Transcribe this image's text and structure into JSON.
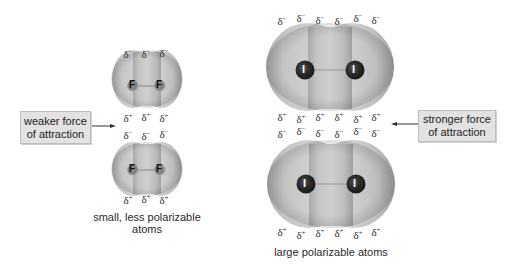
{
  "colors": {
    "cloud_light": "#c8c8c8",
    "cloud_dark": "#8a8a8a",
    "atom_dark": "#2a2a2a",
    "label_box_bg": "#e2e2e2",
    "text": "#222222"
  },
  "delta_neg": "δ",
  "delta_pos": "δ",
  "sign_neg": "−",
  "sign_pos": "+",
  "left_panel": {
    "atom_symbol": "F",
    "caption_line1": "small, less polarizable",
    "caption_line2": "atoms",
    "callout_line1": "weaker force",
    "callout_line2": "of attraction",
    "molecules": [
      {
        "name": "F2 top",
        "delta_neg_count": 3,
        "delta_pos_count": 3
      },
      {
        "name": "F2 bottom",
        "delta_neg_count": 3,
        "delta_pos_count": 3
      }
    ]
  },
  "right_panel": {
    "atom_symbol": "I",
    "caption": "large polarizable atoms",
    "callout_line1": "stronger force",
    "callout_line2": "of attraction",
    "molecules": [
      {
        "name": "I2 top",
        "delta_neg_count": 6,
        "delta_pos_count": 6
      },
      {
        "name": "I2 bottom",
        "delta_neg_count": 6,
        "delta_pos_count": 6
      }
    ]
  }
}
